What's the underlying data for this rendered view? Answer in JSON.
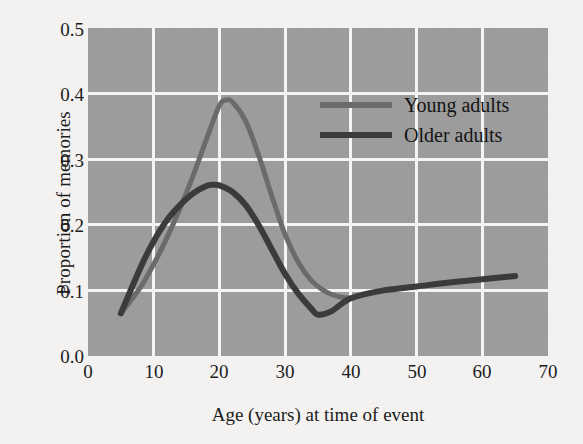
{
  "chart_data": {
    "type": "line",
    "title": "",
    "xlabel": "Age (years) at time of event",
    "ylabel": "Proportion of memories",
    "xlim": [
      0,
      70
    ],
    "ylim": [
      0.0,
      0.5
    ],
    "xticks": [
      0,
      10,
      20,
      30,
      40,
      50,
      60,
      70
    ],
    "xtick_labels": [
      "0",
      "10",
      "20",
      "30",
      "40",
      "50",
      "60",
      "70"
    ],
    "yticks": [
      0.0,
      0.1,
      0.2,
      0.3,
      0.4,
      0.5
    ],
    "ytick_labels": [
      "0.0",
      "0.1",
      "0.2",
      "0.3",
      "0.4",
      "0.5"
    ],
    "grid": true,
    "grid_color": "#f4f4f4",
    "plot_background": "#9c9c9c",
    "figure_background": "#f3f2f0",
    "legend_position": "upper right",
    "series": [
      {
        "name": "Young adults",
        "color": "#6b6b6b",
        "linewidth": 5,
        "x": [
          5,
          8,
          10,
          12,
          14,
          16,
          18,
          20,
          21,
          22,
          24,
          26,
          28,
          30,
          32,
          34,
          36,
          38,
          40
        ],
        "y": [
          0.065,
          0.105,
          0.14,
          0.18,
          0.225,
          0.275,
          0.33,
          0.382,
          0.39,
          0.387,
          0.358,
          0.305,
          0.243,
          0.185,
          0.143,
          0.115,
          0.099,
          0.091,
          0.088
        ]
      },
      {
        "name": "Older adults",
        "color": "#3b3b3b",
        "linewidth": 6,
        "x": [
          5,
          8,
          10,
          12,
          14,
          16,
          18,
          19,
          20,
          22,
          24,
          26,
          28,
          30,
          32,
          34,
          35,
          37,
          40,
          45,
          50,
          55,
          60,
          65
        ],
        "y": [
          0.065,
          0.135,
          0.175,
          0.207,
          0.23,
          0.248,
          0.259,
          0.261,
          0.26,
          0.25,
          0.23,
          0.199,
          0.162,
          0.125,
          0.095,
          0.072,
          0.063,
          0.068,
          0.088,
          0.1,
          0.106,
          0.112,
          0.117,
          0.122
        ]
      }
    ]
  },
  "legend": {
    "items": [
      {
        "label": "Young adults",
        "color": "#6b6b6b"
      },
      {
        "label": "Older adults",
        "color": "#3b3b3b"
      }
    ]
  }
}
